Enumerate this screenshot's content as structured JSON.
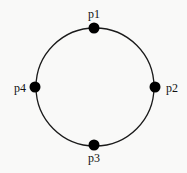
{
  "diagram": {
    "type": "ring",
    "circle": {
      "cx": 95,
      "cy": 87,
      "r": 59,
      "stroke": "#1a1a1a"
    },
    "nodes": [
      {
        "id": "p1",
        "label": "p1",
        "x": 94,
        "y": 28,
        "label_x": 94,
        "label_y": 18,
        "anchor": "middle"
      },
      {
        "id": "p2",
        "label": "p2",
        "x": 155,
        "y": 87,
        "label_x": 166,
        "label_y": 92,
        "anchor": "start"
      },
      {
        "id": "p3",
        "label": "p3",
        "x": 94,
        "y": 145,
        "label_x": 94,
        "label_y": 162,
        "anchor": "middle"
      },
      {
        "id": "p4",
        "label": "p4",
        "x": 35,
        "y": 87,
        "label_x": 26,
        "label_y": 92,
        "anchor": "end"
      }
    ],
    "node_color": "#000000"
  }
}
